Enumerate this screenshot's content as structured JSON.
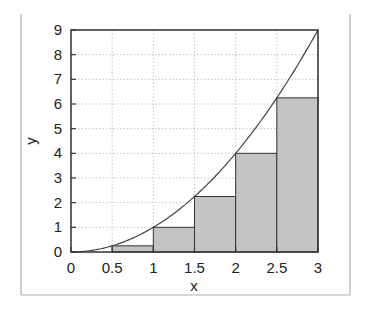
{
  "chart_data": {
    "type": "bar",
    "subtype": "riemann-sum-left-with-curve",
    "title": "",
    "xlabel": "x",
    "ylabel": "y",
    "xlim": [
      0,
      3
    ],
    "ylim": [
      0,
      9
    ],
    "grid": true,
    "legend": null,
    "x_ticks": [
      "0",
      "0.5",
      "1",
      "1.5",
      "2",
      "2.5",
      "3"
    ],
    "y_ticks": [
      "0",
      "1",
      "2",
      "3",
      "4",
      "5",
      "6",
      "7",
      "8",
      "9"
    ],
    "bars": [
      {
        "x0": 0.0,
        "x1": 0.5,
        "height": 0
      },
      {
        "x0": 0.5,
        "x1": 1.0,
        "height": 0.25
      },
      {
        "x0": 1.0,
        "x1": 1.5,
        "height": 1
      },
      {
        "x0": 1.5,
        "x1": 2.0,
        "height": 2.25
      },
      {
        "x0": 2.0,
        "x1": 2.5,
        "height": 4
      },
      {
        "x0": 2.5,
        "x1": 3.0,
        "height": 6.25
      }
    ],
    "categories": [
      "0-0.5",
      "0.5-1",
      "1-1.5",
      "1.5-2",
      "2-2.5",
      "2.5-3"
    ],
    "values": [
      0,
      0.25,
      1,
      2.25,
      4,
      6.25
    ],
    "curve": {
      "expression": "y = x^2",
      "x": [
        0,
        0.5,
        1,
        1.5,
        2,
        2.5,
        3
      ],
      "y": [
        0,
        0.25,
        1,
        2.25,
        4,
        6.25,
        9
      ]
    },
    "colors": {
      "bar_fill": "#c4c4c4",
      "bar_edge": "#333333",
      "curve": "#444444",
      "grid": "#b8b8b8",
      "frame": "#333333",
      "figure_border": "#b0b0b0"
    }
  }
}
